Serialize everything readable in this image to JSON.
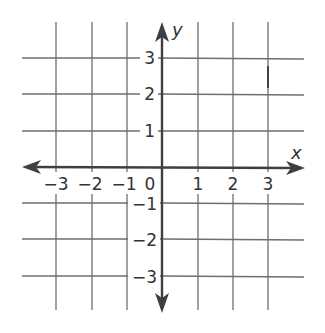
{
  "diagram": {
    "type": "coordinate-plane",
    "x_axis": {
      "label": "x",
      "range": [
        -3,
        3
      ],
      "ticks": [
        {
          "value": -3,
          "label": "−3"
        },
        {
          "value": -2,
          "label": "−2"
        },
        {
          "value": -1,
          "label": "−1"
        },
        {
          "value": 1,
          "label": "1"
        },
        {
          "value": 2,
          "label": "2"
        },
        {
          "value": 3,
          "label": "3"
        }
      ]
    },
    "y_axis": {
      "label": "y",
      "range": [
        -3,
        3
      ],
      "ticks": [
        {
          "value": 3,
          "label": "3"
        },
        {
          "value": 2,
          "label": "2"
        },
        {
          "value": 1,
          "label": "1"
        },
        {
          "value": -1,
          "label": "−1"
        },
        {
          "value": -2,
          "label": "−2"
        },
        {
          "value": -3,
          "label": "−3"
        }
      ]
    },
    "origin_label": "0",
    "grid": true,
    "colors": {
      "grid": "#6e6e6e",
      "axis": "#3f3f3f",
      "text": "#333333",
      "background": "#ffffff"
    }
  }
}
